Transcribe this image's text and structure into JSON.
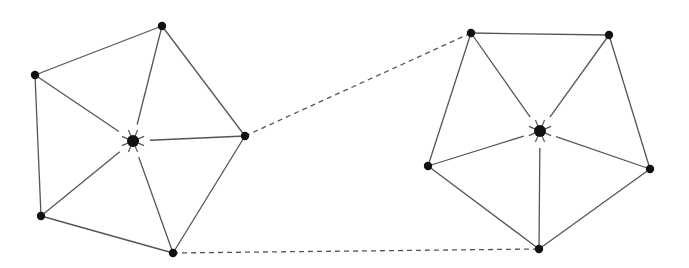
{
  "diagram": {
    "type": "graph",
    "colors": {
      "edge": "#555555",
      "node": "#111111",
      "background": "#ffffff"
    },
    "clusters": [
      {
        "id": "left",
        "hub": {
          "id": "L0",
          "x": 133,
          "y": 141
        },
        "outer": [
          {
            "id": "L1",
            "x": 162,
            "y": 26
          },
          {
            "id": "L2",
            "x": 245,
            "y": 136
          },
          {
            "id": "L3",
            "x": 173,
            "y": 253
          },
          {
            "id": "L4",
            "x": 41,
            "y": 216
          },
          {
            "id": "L5",
            "x": 35,
            "y": 75
          }
        ]
      },
      {
        "id": "right",
        "hub": {
          "id": "R0",
          "x": 540,
          "y": 131
        },
        "outer": [
          {
            "id": "R1",
            "x": 471,
            "y": 33
          },
          {
            "id": "R2",
            "x": 609,
            "y": 35
          },
          {
            "id": "R3",
            "x": 650,
            "y": 169
          },
          {
            "id": "R4",
            "x": 539,
            "y": 249
          },
          {
            "id": "R5",
            "x": 428,
            "y": 166
          }
        ]
      }
    ],
    "dashed_links": [
      {
        "from": "L2",
        "to": "R1"
      },
      {
        "from": "L3",
        "to": "R4"
      }
    ]
  }
}
